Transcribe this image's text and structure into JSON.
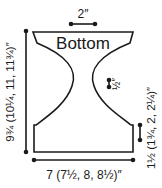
{
  "diagram": {
    "piece_label": "Bottom",
    "dimensions": {
      "top_width": "2″",
      "notch_depth": "½″",
      "height": "9¾ (10¼, 11, 11¾)″",
      "bottom_width": "7 (7½, 8, 8½)″",
      "bottom_band_height": "1½ (1¾, 2, 2¼)″"
    },
    "colors": {
      "stroke": "#1a1a1a",
      "background": "#ffffff"
    }
  }
}
